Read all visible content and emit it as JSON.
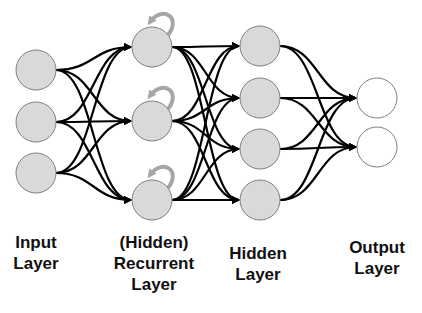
{
  "diagram": {
    "colors": {
      "node_fill": "#d9d9d9",
      "node_stroke": "#7f7f7f",
      "output_fill": "#ffffff",
      "edge": "#000000",
      "recurrent_arrow": "#a6a6a6"
    },
    "node_radius": 20,
    "layers": [
      {
        "id": "input",
        "x": 36,
        "nodes_y": [
          70,
          122,
          173
        ],
        "fill": "#d9d9d9"
      },
      {
        "id": "recurrent",
        "x": 152,
        "nodes_y": [
          47,
          121,
          200
        ],
        "fill": "#d9d9d9",
        "self_loop": true
      },
      {
        "id": "hidden",
        "x": 260,
        "nodes_y": [
          46,
          98,
          149,
          200
        ],
        "fill": "#d9d9d9"
      },
      {
        "id": "output",
        "x": 377,
        "nodes_y": [
          98,
          147
        ],
        "fill": "#ffffff"
      }
    ]
  },
  "labels": {
    "input": {
      "line1": "Input",
      "line2": "Layer"
    },
    "recurrent": {
      "line1": "(Hidden)",
      "line2": "Recurrent",
      "line3": "Layer"
    },
    "hidden": {
      "line1": "Hidden",
      "line2": "Layer"
    },
    "output": {
      "line1": "Output",
      "line2": "Layer"
    }
  }
}
